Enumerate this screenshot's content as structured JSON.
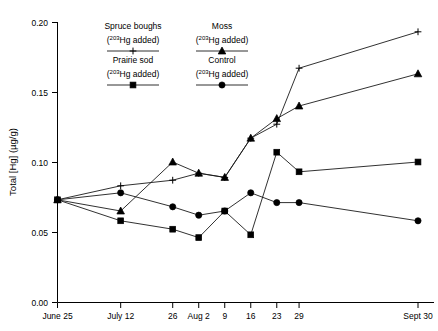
{
  "chart_data": {
    "type": "line",
    "title": "",
    "xlabel": "",
    "ylabel": "Total [Hg] (µg/g)",
    "ylim": [
      0.0,
      0.2
    ],
    "yticks": [
      0.0,
      0.05,
      0.1,
      0.15,
      0.2
    ],
    "ytick_labels": [
      "0.00",
      "0.05",
      "0.10",
      "0.15",
      "0.20"
    ],
    "grid": false,
    "legend_position": "top-left-inside",
    "x": [
      0,
      17,
      31,
      38,
      45,
      52,
      59,
      65,
      97
    ],
    "categories": [
      "June 25",
      "July 12",
      "26",
      "Aug 2",
      "9",
      "16",
      "23",
      "29",
      "Sept 30"
    ],
    "xtick_labels": [
      "June 25",
      "July 12",
      "26",
      "Aug 2",
      "9",
      "16",
      "23",
      "29",
      "Sept 30"
    ],
    "series": [
      {
        "name": "Spruce boughs",
        "sublabel": "(203Hg added)",
        "isotope": "203",
        "element": "Hg added",
        "marker": "plus",
        "values": [
          0.073,
          0.083,
          0.087,
          0.092,
          0.089,
          0.117,
          0.127,
          0.167,
          0.193
        ]
      },
      {
        "name": "Moss",
        "sublabel": "(203Hg added)",
        "isotope": "203",
        "element": "Hg added",
        "marker": "triangle",
        "values": [
          0.073,
          0.065,
          0.1,
          0.092,
          0.089,
          0.117,
          0.131,
          0.14,
          0.163
        ]
      },
      {
        "name": "Prairie sod",
        "sublabel": "(203Hg added)",
        "isotope": "203",
        "element": "Hg added",
        "marker": "square",
        "values": [
          0.073,
          0.058,
          0.052,
          0.046,
          0.065,
          0.048,
          0.107,
          0.093,
          0.1
        ]
      },
      {
        "name": "Control",
        "sublabel": "(203Hg added)",
        "isotope": "203",
        "element": "Hg added",
        "marker": "circle",
        "values": [
          0.073,
          0.078,
          0.068,
          0.062,
          0.065,
          0.078,
          0.071,
          0.071,
          0.058
        ]
      }
    ]
  },
  "legend": {
    "entries": [
      {
        "title": "Spruce boughs",
        "sub_pre": "(",
        "sub_iso": "203",
        "sub_post": "Hg added)",
        "marker": "plus"
      },
      {
        "title": "Moss",
        "sub_pre": "(",
        "sub_iso": "203",
        "sub_post": "Hg added)",
        "marker": "triangle"
      },
      {
        "title": "Prairie sod",
        "sub_pre": "(",
        "sub_iso": "203",
        "sub_post": "Hg added)",
        "marker": "square"
      },
      {
        "title": "Control",
        "sub_pre": "(",
        "sub_iso": "203",
        "sub_post": "Hg added)",
        "marker": "circle"
      }
    ]
  },
  "colors": {
    "ink": "#000000",
    "line": "#1a1a1a",
    "background": "#ffffff"
  }
}
